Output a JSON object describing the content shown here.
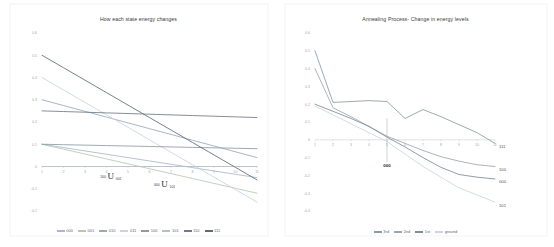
{
  "chart_data": [
    {
      "type": "line",
      "title": "How each state energy changes",
      "xlabel": "",
      "ylabel": "",
      "x": [
        1,
        2,
        3,
        4,
        5,
        6,
        7,
        8,
        9,
        10,
        11
      ],
      "xlim": [
        1,
        11
      ],
      "ylim": [
        -0.2,
        0.6
      ],
      "yticks": [
        0.6,
        0.5,
        0.4,
        0.3,
        0.2,
        0.1,
        0,
        -0.1,
        -0.2
      ],
      "ytick_labels": [
        "0.6",
        "0.5",
        "0.4",
        "0.3",
        "0.2",
        "0.1",
        "0",
        "-0.1",
        "-0.2"
      ],
      "xticks": [
        1,
        2,
        3,
        4,
        5,
        6,
        7,
        8,
        9,
        10,
        11
      ],
      "xtick_labels": [
        "1",
        "2",
        "3",
        "4",
        "5",
        "6",
        "7",
        "8",
        "9",
        "10",
        "11"
      ],
      "grid": false,
      "legend_position": "bottom",
      "series": [
        {
          "name": "000",
          "color": "#a8b8c8",
          "values": [
            0.1,
            0.085,
            0.07,
            0.055,
            0.04,
            0.025,
            0.01,
            -0.005,
            -0.02,
            -0.035,
            -0.05
          ]
        },
        {
          "name": "001",
          "color": "#b9c6b2",
          "values": [
            0.1,
            0.078,
            0.056,
            0.034,
            0.012,
            -0.01,
            -0.032,
            -0.054,
            -0.076,
            -0.098,
            -0.12
          ]
        },
        {
          "name": "010",
          "color": "#9aa9b8",
          "values": [
            0.3,
            0.274,
            0.248,
            0.222,
            0.196,
            0.17,
            0.144,
            0.118,
            0.092,
            0.066,
            0.04
          ]
        },
        {
          "name": "011",
          "color": "#c9d3dd",
          "values": [
            0.4,
            0.344,
            0.288,
            0.232,
            0.176,
            0.12,
            0.064,
            0.008,
            -0.048,
            -0.104,
            -0.16
          ]
        },
        {
          "name": "100",
          "color": "#8e9aa6",
          "values": [
            0.1,
            0.098,
            0.096,
            0.094,
            0.092,
            0.09,
            0.088,
            0.086,
            0.084,
            0.082,
            0.08
          ]
        },
        {
          "name": "101",
          "color": "#b3bfc9",
          "values": [
            0.0,
            0.0,
            0.0,
            0.0,
            0.0,
            0.0,
            0.0,
            0.0,
            0.0,
            0.0,
            0.0
          ]
        },
        {
          "name": "110",
          "color": "#6f7b87",
          "values": [
            0.25,
            0.247,
            0.244,
            0.241,
            0.238,
            0.235,
            0.232,
            0.229,
            0.226,
            0.223,
            0.22
          ]
        },
        {
          "name": "111",
          "color": "#5e6a76",
          "values": [
            0.5,
            0.444,
            0.388,
            0.332,
            0.276,
            0.22,
            0.164,
            0.108,
            0.052,
            -0.004,
            -0.06
          ]
        }
      ],
      "annotations": [
        {
          "text_left": "100",
          "glyph": "U",
          "text_right": "001",
          "x": 4.2,
          "y": -0.022
        },
        {
          "text_left": "000",
          "glyph": "U",
          "text_right": "101",
          "x": 6.7,
          "y": -0.058
        }
      ]
    },
    {
      "type": "line",
      "title": "Annealing Process- Change in energy levels",
      "xlabel": "",
      "ylabel": "",
      "x": [
        1,
        2,
        3,
        4,
        5,
        6,
        7,
        8,
        9,
        10,
        11
      ],
      "xlim": [
        1,
        11
      ],
      "ylim": [
        -0.4,
        0.6
      ],
      "yticks": [
        0.6,
        0.5,
        0.4,
        0.3,
        0.2,
        0.1,
        0,
        -0.1,
        -0.2,
        -0.3,
        -0.4
      ],
      "ytick_labels": [
        "0.6",
        "0.5",
        "0.4",
        "0.3",
        "0.2",
        "0.1",
        "0",
        "-0.1",
        "-0.2",
        "-0.3",
        "-0.4"
      ],
      "xticks": [
        1,
        2,
        3,
        4,
        5,
        6,
        7,
        8,
        9,
        10,
        11
      ],
      "xtick_labels": [
        "1",
        "2",
        "3",
        "4",
        "5",
        "6",
        "7",
        "8",
        "9",
        "10",
        "11"
      ],
      "grid": false,
      "legend_position": "bottom",
      "series": [
        {
          "name": "3rd",
          "color": "#8d99a6",
          "values": [
            0.5,
            0.21,
            0.215,
            0.22,
            0.215,
            0.12,
            0.17,
            0.13,
            0.085,
            0.04,
            -0.02
          ]
        },
        {
          "name": "2nd",
          "color": "#9aa6b2",
          "values": [
            0.4,
            0.18,
            0.13,
            0.075,
            0.02,
            -0.02,
            -0.06,
            -0.095,
            -0.12,
            -0.14,
            -0.15
          ]
        },
        {
          "name": "1st",
          "color": "#7f8b97",
          "values": [
            0.2,
            0.16,
            0.12,
            0.075,
            0.015,
            -0.04,
            -0.1,
            -0.155,
            -0.195,
            -0.21,
            -0.22
          ]
        },
        {
          "name": "ground",
          "color": "#ccd6e0",
          "values": [
            0.19,
            0.14,
            0.09,
            0.04,
            -0.01,
            -0.08,
            -0.15,
            -0.21,
            -0.27,
            -0.31,
            -0.35
          ]
        }
      ],
      "end_labels": [
        {
          "text": "111",
          "series": "3rd"
        },
        {
          "text": "100",
          "series": "2nd"
        },
        {
          "text": "000",
          "series": "1st"
        },
        {
          "text": "101",
          "series": "ground"
        }
      ],
      "annotations": [
        {
          "text": "000",
          "x": 5,
          "y": -0.12
        }
      ]
    }
  ],
  "left_chart": {
    "title": "How each state energy changes",
    "legend": [
      {
        "label": "000"
      },
      {
        "label": "001"
      },
      {
        "label": "010"
      },
      {
        "label": "011"
      },
      {
        "label": "100"
      },
      {
        "label": "101"
      },
      {
        "label": "110"
      },
      {
        "label": "111"
      }
    ]
  },
  "right_chart": {
    "title": "Annealing Process- Change in energy levels",
    "legend": [
      {
        "label": "3rd"
      },
      {
        "label": "2nd"
      },
      {
        "label": "1st"
      },
      {
        "label": "ground"
      }
    ]
  }
}
